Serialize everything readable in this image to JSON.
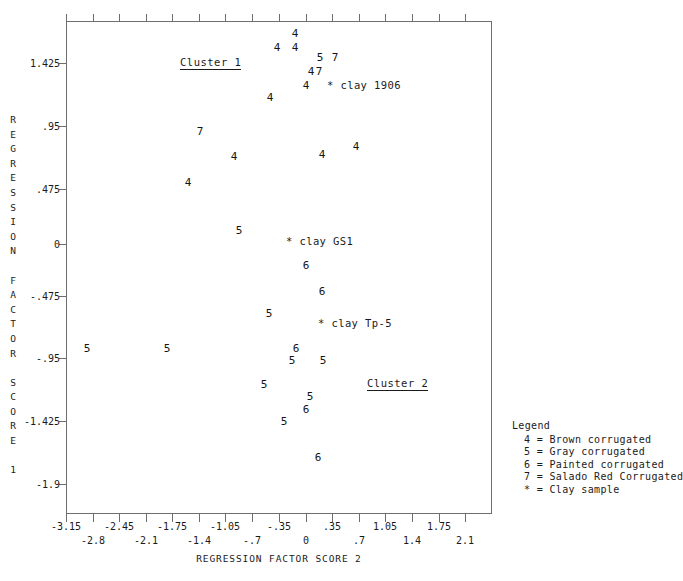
{
  "chart_data": {
    "type": "scatter",
    "title": "",
    "xlabel": "REGRESSION FACTOR SCORE  2",
    "ylabel": "REGRESSION FACTOR SCORE 1",
    "xlim": [
      -3.5,
      2.45
    ],
    "ylim": [
      -2.2,
      1.74
    ],
    "grid": false,
    "legend_position": "right-bottom-outside",
    "x_ticks_row1": [
      "-3.15",
      "-2.45",
      "-1.75",
      "-1.05",
      "-.35",
      ".35",
      "1.05",
      "1.75"
    ],
    "x_ticks_row2": [
      "-2.8",
      "-2.1",
      "-1.4",
      "-.7",
      "0",
      ".7",
      "1.4",
      "2.1"
    ],
    "y_ticks": [
      "1.425",
      ".95",
      ".475",
      "0",
      "-.475",
      "-.95",
      "-1.425",
      "-1.9"
    ],
    "series": [
      {
        "name": "Brown corrugated",
        "symbol": "4",
        "points": [
          {
            "x": -0.3,
            "y": 1.66
          },
          {
            "x": -0.56,
            "y": 1.55
          },
          {
            "x": -0.3,
            "y": 1.55
          },
          {
            "x": -0.24,
            "y": 1.36
          },
          {
            "x": -0.33,
            "y": 1.27
          },
          {
            "x": -0.6,
            "y": 1.15
          },
          {
            "x": -1.5,
            "y": 0.72
          },
          {
            "x": -0.37,
            "y": 0.7
          },
          {
            "x": 0.05,
            "y": 0.74
          },
          {
            "x": -1.77,
            "y": 0.47
          }
        ]
      },
      {
        "name": "Gray corrugated",
        "symbol": "5",
        "points": [
          {
            "x": -0.12,
            "y": 1.47
          },
          {
            "x": -1.42,
            "y": 0.1
          },
          {
            "x": -0.69,
            "y": -0.56
          },
          {
            "x": -3.02,
            "y": -0.93
          },
          {
            "x": -2.28,
            "y": -0.93
          },
          {
            "x": -0.42,
            "y": -0.98
          },
          {
            "x": -0.08,
            "y": -0.98
          },
          {
            "x": -0.78,
            "y": -1.13
          },
          {
            "x": -0.26,
            "y": -1.22
          },
          {
            "x": -0.42,
            "y": -1.39
          }
        ]
      },
      {
        "name": "Painted corrugated",
        "symbol": "6",
        "points": [
          {
            "x": -0.21,
            "y": -0.16
          },
          {
            "x": -0.12,
            "y": -0.39
          },
          {
            "x": -0.37,
            "y": -0.92
          },
          {
            "x": -0.33,
            "y": -1.3
          },
          {
            "x": -0.2,
            "y": -1.65
          }
        ]
      },
      {
        "name": "Salado Red Corrugated",
        "symbol": "7",
        "points": [
          {
            "x": 0.03,
            "y": 1.47
          },
          {
            "x": -0.21,
            "y": 1.27
          },
          {
            "x": -1.85,
            "y": 0.93
          }
        ]
      },
      {
        "name": "Clay sample",
        "symbol": "*",
        "points": [
          {
            "x": -0.21,
            "y": 1.15,
            "label": "clay 1906"
          },
          {
            "x": -0.46,
            "y": 0.01,
            "label": "clay GS1"
          },
          {
            "x": -0.27,
            "y": -0.59,
            "label": "clay Tp-5"
          }
        ]
      }
    ],
    "annotations": [
      {
        "text": "Cluster 1",
        "x": -1.52,
        "y": 1.43,
        "underlined": true
      },
      {
        "text": "Cluster 2",
        "x": 0.34,
        "y": -1.02,
        "underlined": true
      }
    ]
  },
  "axes": {
    "y_title_chars": [
      "R",
      "E",
      "G",
      "R",
      "E",
      "S",
      "S",
      "I",
      "O",
      "N",
      "",
      "F",
      "A",
      "C",
      "T",
      "O",
      "R",
      "",
      "S",
      "C",
      "O",
      "R",
      "E",
      "",
      "1"
    ],
    "x_title": "REGRESSION FACTOR SCORE  2"
  },
  "legend": {
    "title": "Legend",
    "entries": [
      "4 = Brown corrugated",
      "5 = Gray corrugated",
      "6 = Painted corrugated",
      "7 = Salado Red Corrugated",
      "* = Clay sample"
    ]
  },
  "plot_points": [
    {
      "sym": "4",
      "px": 295,
      "py": 33
    },
    {
      "sym": "4",
      "px": 277,
      "py": 47
    },
    {
      "sym": "4",
      "px": 295,
      "py": 47
    },
    {
      "sym": "5",
      "px": 320,
      "py": 57
    },
    {
      "sym": "7",
      "px": 335,
      "py": 57
    },
    {
      "sym": "4",
      "px": 311,
      "py": 71
    },
    {
      "sym": "7",
      "px": 319,
      "py": 71
    },
    {
      "sym": "4",
      "px": 306,
      "py": 85
    },
    {
      "sym": "4",
      "px": 270,
      "py": 97
    },
    {
      "sym": "7",
      "px": 200,
      "py": 131
    },
    {
      "sym": "4",
      "px": 234,
      "py": 156
    },
    {
      "sym": "4",
      "px": 322,
      "py": 154
    },
    {
      "sym": "4",
      "px": 356,
      "py": 146
    },
    {
      "sym": "4",
      "px": 188,
      "py": 182
    },
    {
      "sym": "5",
      "px": 239,
      "py": 230
    },
    {
      "sym": "6",
      "px": 306,
      "py": 265
    },
    {
      "sym": "6",
      "px": 322,
      "py": 291
    },
    {
      "sym": "5",
      "px": 269,
      "py": 313
    },
    {
      "sym": "5",
      "px": 87,
      "py": 348
    },
    {
      "sym": "5",
      "px": 167,
      "py": 348
    },
    {
      "sym": "6",
      "px": 296,
      "py": 348
    },
    {
      "sym": "5",
      "px": 292,
      "py": 360
    },
    {
      "sym": "5",
      "px": 323,
      "py": 360
    },
    {
      "sym": "5",
      "px": 264,
      "py": 384
    },
    {
      "sym": "5",
      "px": 310,
      "py": 396
    },
    {
      "sym": "6",
      "px": 306,
      "py": 409
    },
    {
      "sym": "5",
      "px": 284,
      "py": 421
    },
    {
      "sym": "6",
      "px": 318,
      "py": 457
    }
  ],
  "clay_labels": [
    {
      "text": "* clay 1906",
      "px": 327,
      "py": 85
    },
    {
      "text": "* clay GS1",
      "px": 286,
      "py": 241
    },
    {
      "text": "* clay Tp-5",
      "px": 318,
      "py": 323
    }
  ],
  "cluster_labels": [
    {
      "text": "Cluster 1",
      "px": 180,
      "py": 56
    },
    {
      "text": "Cluster 2",
      "px": 367,
      "py": 377
    }
  ],
  "x_tick_labels": [
    {
      "text": "-3.15",
      "px": 66,
      "row": 1
    },
    {
      "text": "-2.8",
      "px": 93,
      "row": 2
    },
    {
      "text": "-2.45",
      "px": 119,
      "row": 1
    },
    {
      "text": "-2.1",
      "px": 146,
      "row": 2
    },
    {
      "text": "-1.75",
      "px": 172,
      "row": 1
    },
    {
      "text": "-1.4",
      "px": 199,
      "row": 2
    },
    {
      "text": "-1.05",
      "px": 225,
      "row": 1
    },
    {
      "text": "-.7",
      "px": 252,
      "row": 2
    },
    {
      "text": "-.35",
      "px": 279,
      "row": 1
    },
    {
      "text": "0",
      "px": 306,
      "row": 2
    },
    {
      "text": ".35",
      "px": 332,
      "row": 1
    },
    {
      "text": ".7",
      "px": 359,
      "row": 2
    },
    {
      "text": "1.05",
      "px": 385,
      "row": 1
    },
    {
      "text": "1.4",
      "px": 412,
      "row": 2
    },
    {
      "text": "1.75",
      "px": 439,
      "row": 1
    },
    {
      "text": "2.1",
      "px": 465,
      "row": 2
    }
  ],
  "y_tick_labels": [
    {
      "text": "1.425",
      "py": 63
    },
    {
      "text": ".95",
      "py": 126
    },
    {
      "text": ".475",
      "py": 189
    },
    {
      "text": "0",
      "py": 244
    },
    {
      "text": "-.475",
      "py": 296
    },
    {
      "text": "-.95",
      "py": 358
    },
    {
      "text": "-1.425",
      "py": 421
    },
    {
      "text": "-1.9",
      "py": 484
    }
  ]
}
